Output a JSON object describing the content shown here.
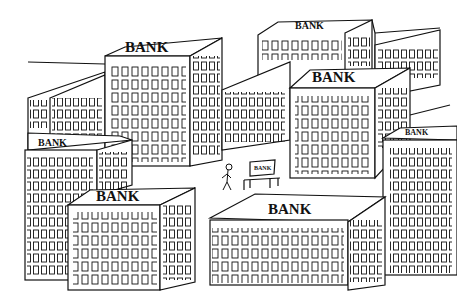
{
  "illustration": {
    "description": "Cartoon of a city street lined with many office buildings all labeled BANK; a tiny man walks toward a park bench also labeled BANK",
    "palette": {
      "ink": "#111111",
      "paper": "#ffffff"
    },
    "signs": {
      "top_left_building": "BANK",
      "top_center_building": "BANK",
      "center_right_building": "BANK",
      "left_mid_building": "BANK",
      "far_right_building": "BANK",
      "bottom_left_building": "BANK",
      "bottom_center_building": "BANK",
      "bench": "BANK"
    },
    "figures": [
      {
        "name": "walking-man",
        "position": "street center"
      },
      {
        "name": "park-bench",
        "position": "street center right"
      }
    ]
  }
}
